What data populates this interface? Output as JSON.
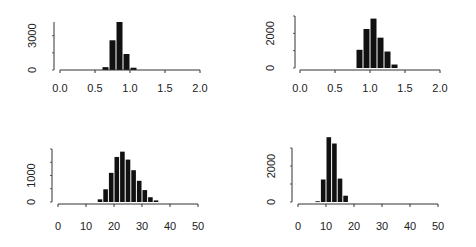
{
  "chart_data": [
    {
      "type": "bar",
      "title": "",
      "xlabel": "",
      "ylabel": "",
      "xlim": [
        0.0,
        2.0
      ],
      "ylim": [
        0,
        4300
      ],
      "xticks": [
        "0.0",
        "0.5",
        "1.0",
        "1.5",
        "2.0"
      ],
      "yticks": [
        "0",
        "3000"
      ],
      "ytick_values": [
        0,
        3000
      ],
      "bin_width": 0.1,
      "bins_start": [
        0.6,
        0.7,
        0.8,
        0.9,
        1.0
      ],
      "values": [
        250,
        2600,
        4200,
        1400,
        200
      ],
      "grid": false,
      "legend": null
    },
    {
      "type": "bar",
      "title": "",
      "xlabel": "",
      "ylabel": "",
      "xlim": [
        0.0,
        2.0
      ],
      "ylim": [
        0,
        3100
      ],
      "xticks": [
        "0.0",
        "0.5",
        "1.0",
        "1.5",
        "2.0"
      ],
      "yticks": [
        "0",
        "2000"
      ],
      "ytick_values": [
        0,
        2000
      ],
      "bin_width": 0.1,
      "bins_start": [
        0.8,
        0.9,
        1.0,
        1.1,
        1.2,
        1.3
      ],
      "values": [
        1050,
        2250,
        2850,
        1750,
        950,
        200
      ],
      "grid": false,
      "legend": null
    },
    {
      "type": "bar",
      "title": "",
      "xlabel": "",
      "ylabel": "",
      "xlim": [
        0,
        50
      ],
      "ylim": [
        0,
        2000
      ],
      "xticks": [
        "0",
        "10",
        "20",
        "30",
        "40",
        "50"
      ],
      "yticks": [
        "0",
        "1000"
      ],
      "ytick_values": [
        0,
        1000
      ],
      "bin_width": 2,
      "bins_start": [
        14,
        16,
        18,
        20,
        22,
        24,
        26,
        28,
        30,
        32,
        34
      ],
      "values": [
        100,
        480,
        1100,
        1700,
        1900,
        1600,
        1200,
        800,
        450,
        180,
        60
      ],
      "grid": false,
      "legend": null
    },
    {
      "type": "bar",
      "title": "",
      "xlabel": "",
      "ylabel": "",
      "xlim": [
        0,
        50
      ],
      "ylim": [
        0,
        3800
      ],
      "xticks": [
        "0",
        "10",
        "20",
        "30",
        "40",
        "50"
      ],
      "yticks": [
        "0",
        "2000"
      ],
      "ytick_values": [
        0,
        2000
      ],
      "bin_width": 2,
      "bins_start": [
        6,
        8,
        10,
        12,
        14,
        16
      ],
      "values": [
        40,
        1250,
        3600,
        3250,
        1300,
        350
      ],
      "grid": false,
      "legend": null
    }
  ],
  "panels": [
    {
      "id": "hist-top-left",
      "axis_top_value": 4200
    },
    {
      "id": "hist-top-right",
      "axis_top_value": 3000
    },
    {
      "id": "hist-bottom-left",
      "axis_top_value": 2000
    },
    {
      "id": "hist-bottom-right",
      "axis_top_value": 3000
    }
  ],
  "colors": {
    "bar": "#111111",
    "axis": "#333333",
    "text": "#222222",
    "background": "#ffffff"
  }
}
